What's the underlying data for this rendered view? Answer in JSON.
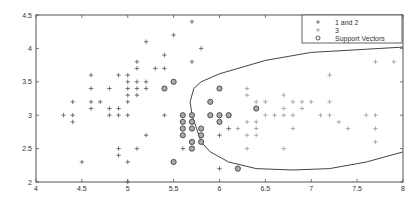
{
  "chart_data": {
    "type": "scatter",
    "title": "",
    "xlabel": "",
    "ylabel": "",
    "xlim": [
      4,
      8
    ],
    "ylim": [
      2,
      4.5
    ],
    "grid": false,
    "legend_position": "upper right",
    "x_ticks": [
      "4",
      "4.5",
      "5",
      "5.5",
      "6",
      "6.5",
      "7",
      "7.5",
      "8"
    ],
    "y_ticks": [
      "2",
      "2.5",
      "3",
      "3.5",
      "4",
      "4.5"
    ],
    "legend": [
      {
        "label": "1 and 2",
        "marker": "+",
        "color": "#555555"
      },
      {
        "label": "3",
        "marker": "+",
        "color": "#999999"
      },
      {
        "label": "Support Vectors",
        "marker": "o",
        "color": "#555555"
      }
    ],
    "series": [
      {
        "name": "1 and 2",
        "marker": "+",
        "points": [
          [
            4.3,
            3.0
          ],
          [
            4.4,
            2.9
          ],
          [
            4.4,
            3.0
          ],
          [
            4.4,
            3.2
          ],
          [
            4.5,
            2.3
          ],
          [
            4.6,
            3.1
          ],
          [
            4.6,
            3.2
          ],
          [
            4.6,
            3.4
          ],
          [
            4.6,
            3.6
          ],
          [
            4.7,
            3.2
          ],
          [
            4.8,
            3.0
          ],
          [
            4.8,
            3.1
          ],
          [
            4.8,
            3.4
          ],
          [
            4.9,
            2.4
          ],
          [
            4.9,
            2.5
          ],
          [
            4.9,
            3.0
          ],
          [
            4.9,
            3.1
          ],
          [
            4.9,
            3.6
          ],
          [
            5.0,
            2.0
          ],
          [
            5.0,
            2.3
          ],
          [
            5.0,
            3.0
          ],
          [
            5.0,
            3.2
          ],
          [
            5.0,
            3.3
          ],
          [
            5.0,
            3.4
          ],
          [
            5.0,
            3.5
          ],
          [
            5.0,
            3.6
          ],
          [
            5.1,
            2.5
          ],
          [
            5.1,
            3.3
          ],
          [
            5.1,
            3.4
          ],
          [
            5.1,
            3.5
          ],
          [
            5.1,
            3.7
          ],
          [
            5.1,
            3.8
          ],
          [
            5.2,
            2.7
          ],
          [
            5.2,
            3.4
          ],
          [
            5.2,
            3.5
          ],
          [
            5.2,
            4.1
          ],
          [
            5.3,
            3.7
          ],
          [
            5.4,
            3.0
          ],
          [
            5.4,
            3.4
          ],
          [
            5.4,
            3.7
          ],
          [
            5.4,
            3.9
          ],
          [
            5.5,
            4.2
          ],
          [
            5.6,
            2.5
          ],
          [
            5.6,
            2.7
          ],
          [
            5.6,
            2.8
          ],
          [
            5.6,
            2.9
          ],
          [
            5.6,
            3.0
          ],
          [
            5.7,
            2.6
          ],
          [
            5.7,
            3.8
          ],
          [
            5.7,
            4.4
          ],
          [
            5.8,
            4.0
          ],
          [
            5.8,
            2.7
          ],
          [
            6.0,
            2.2
          ],
          [
            6.0,
            2.7
          ],
          [
            6.1,
            2.8
          ],
          [
            6.1,
            3.0
          ],
          [
            6.2,
            2.2
          ]
        ]
      },
      {
        "name": "3",
        "marker": "+",
        "points": [
          [
            6.1,
            3.0
          ],
          [
            6.2,
            2.8
          ],
          [
            6.3,
            2.5
          ],
          [
            6.3,
            2.7
          ],
          [
            6.3,
            2.9
          ],
          [
            6.3,
            3.3
          ],
          [
            6.3,
            3.4
          ],
          [
            6.4,
            2.7
          ],
          [
            6.4,
            2.8
          ],
          [
            6.4,
            2.9
          ],
          [
            6.4,
            3.2
          ],
          [
            6.5,
            3.0
          ],
          [
            6.5,
            3.2
          ],
          [
            6.6,
            3.0
          ],
          [
            6.7,
            2.5
          ],
          [
            6.7,
            3.0
          ],
          [
            6.7,
            3.1
          ],
          [
            6.7,
            3.3
          ],
          [
            6.8,
            2.8
          ],
          [
            6.8,
            3.0
          ],
          [
            6.8,
            3.2
          ],
          [
            6.9,
            3.1
          ],
          [
            6.9,
            3.2
          ],
          [
            7.0,
            3.2
          ],
          [
            7.1,
            3.0
          ],
          [
            7.2,
            3.0
          ],
          [
            7.2,
            3.2
          ],
          [
            7.2,
            3.6
          ],
          [
            7.3,
            2.9
          ],
          [
            7.4,
            2.8
          ],
          [
            7.6,
            3.0
          ],
          [
            7.7,
            2.6
          ],
          [
            7.7,
            2.8
          ],
          [
            7.7,
            3.0
          ],
          [
            7.7,
            3.8
          ],
          [
            7.9,
            3.8
          ]
        ]
      },
      {
        "name": "Support Vectors",
        "marker": "o",
        "points": [
          [
            5.4,
            3.4
          ],
          [
            5.5,
            3.5
          ],
          [
            5.5,
            2.3
          ],
          [
            5.6,
            3.0
          ],
          [
            5.6,
            2.9
          ],
          [
            5.6,
            2.8
          ],
          [
            5.6,
            2.7
          ],
          [
            5.7,
            3.0
          ],
          [
            5.7,
            2.9
          ],
          [
            5.7,
            2.8
          ],
          [
            5.7,
            2.6
          ],
          [
            5.7,
            2.5
          ],
          [
            5.8,
            2.8
          ],
          [
            5.8,
            2.7
          ],
          [
            5.8,
            2.6
          ],
          [
            5.9,
            3.2
          ],
          [
            5.9,
            3.0
          ],
          [
            6.0,
            3.4
          ],
          [
            6.0,
            3.0
          ],
          [
            6.0,
            2.9
          ],
          [
            6.1,
            3.0
          ],
          [
            6.2,
            2.2
          ],
          [
            6.4,
            3.1
          ]
        ]
      }
    ],
    "decision_boundary": {
      "description": "closed curve enclosing class 3 region, opening to the right",
      "points": [
        [
          8.0,
          4.02
        ],
        [
          7.0,
          3.94
        ],
        [
          6.5,
          3.82
        ],
        [
          6.0,
          3.62
        ],
        [
          5.8,
          3.5
        ],
        [
          5.72,
          3.4
        ],
        [
          5.68,
          3.2
        ],
        [
          5.7,
          3.0
        ],
        [
          5.75,
          2.8
        ],
        [
          5.8,
          2.6
        ],
        [
          5.9,
          2.45
        ],
        [
          6.1,
          2.3
        ],
        [
          6.4,
          2.2
        ],
        [
          6.8,
          2.18
        ],
        [
          7.2,
          2.2
        ],
        [
          7.6,
          2.3
        ],
        [
          8.0,
          2.45
        ]
      ]
    }
  }
}
